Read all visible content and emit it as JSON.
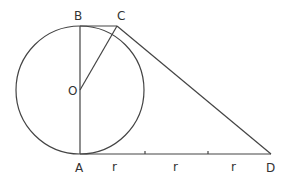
{
  "diagram": {
    "title": "",
    "points": {
      "O": {
        "label": "O",
        "x": 80,
        "y": 90
      },
      "A": {
        "label": "A",
        "x": 80,
        "y": 154
      },
      "B": {
        "label": "B",
        "x": 80,
        "y": 26
      },
      "C": {
        "label": "C",
        "x": 117,
        "y": 26
      },
      "D": {
        "label": "D",
        "x": 271,
        "y": 154
      }
    },
    "circle": {
      "center": "O",
      "radius": 64
    },
    "segments": [
      "AB",
      "BC",
      "OC",
      "CD",
      "AD"
    ],
    "segment_labels": [
      {
        "label": "r",
        "x": 112
      },
      {
        "label": "r",
        "x": 175
      },
      {
        "label": "r",
        "x": 235
      }
    ],
    "ticks_on_AD": [
      145,
      208
    ],
    "stroke_color": "#444444"
  }
}
